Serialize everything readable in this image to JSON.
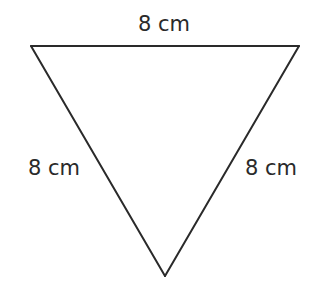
{
  "diagram": {
    "type": "equilateral-triangle",
    "orientation": "inverted",
    "stroke_color": "#2a2a2a",
    "stroke_width": 2,
    "vertices": {
      "top_left": [
        31,
        46
      ],
      "top_right": [
        299,
        46
      ],
      "bottom": [
        165,
        276
      ]
    },
    "sides": {
      "top": {
        "length": "8 cm"
      },
      "left": {
        "length": "8 cm"
      },
      "right": {
        "length": "8 cm"
      }
    }
  }
}
